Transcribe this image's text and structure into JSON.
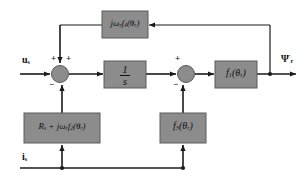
{
  "diagram": {
    "canvas": {
      "width": 307,
      "height": 182
    },
    "colors": {
      "block_fill": "#8c8c8c",
      "block_stroke": "#5a5a5a",
      "wire": "#1a1a1a",
      "background": "#ffffff",
      "text": "#111111"
    },
    "inputs": [
      {
        "id": "u_s",
        "label_html": "u<sub>s</sub>",
        "label_text": "us",
        "x": 22,
        "y": 57
      },
      {
        "id": "i_s",
        "label_html": "i<sub>s</sub>",
        "label_text": "is",
        "x": 22,
        "y": 156
      }
    ],
    "outputs": [
      {
        "id": "psi_r",
        "label_html": "Ψ<sup>′</sup><sub>r</sub>",
        "label_text": "Psi'r",
        "x": 283,
        "y": 58
      }
    ],
    "blocks": [
      {
        "id": "f4",
        "label_html": "jω<sub>r</sub>f<sub>4</sub>(θ<sub>r</sub>)",
        "label_text": "jωr f4(θr)",
        "x": 102,
        "y": 11,
        "w": 46,
        "h": 27,
        "font_size": 9
      },
      {
        "id": "integrator",
        "label_html": "",
        "label_text": "1/s",
        "numerator": "1",
        "denominator": "s",
        "x": 104,
        "y": 61,
        "w": 42,
        "h": 27,
        "font_size": 11
      },
      {
        "id": "f1",
        "label_html": "f<sub>1</sub>(θ<sub>r</sub>)",
        "label_text": "f1(θr)",
        "x": 215,
        "y": 61,
        "w": 42,
        "h": 27,
        "font_size": 10
      },
      {
        "id": "rs_jw_f2",
        "label_html": "R<sub>s</sub> + jω<sub>r</sub>f<sub>2</sub>(θ<sub>r</sub>)",
        "label_text": "Rs + jωr f2(θr)",
        "x": 24,
        "y": 113,
        "w": 76,
        "h": 30,
        "font_size": 9
      },
      {
        "id": "f3",
        "label_html": "f<sub>3</sub>(θ<sub>r</sub>)",
        "label_text": "f3(θr)",
        "x": 160,
        "y": 113,
        "w": 46,
        "h": 30,
        "font_size": 10
      }
    ],
    "summing_junctions": [
      {
        "id": "sum1",
        "cx": 60,
        "cy": 74,
        "r": 8.5,
        "signs": [
          {
            "symbol": "+",
            "x": 51,
            "y": 57
          },
          {
            "symbol": "+",
            "x": 66,
            "y": 57
          },
          {
            "symbol": "−",
            "x": 50,
            "y": 84
          }
        ]
      },
      {
        "id": "sum2",
        "cx": 186,
        "cy": 74,
        "r": 8.5,
        "signs": [
          {
            "symbol": "+",
            "x": 175,
            "y": 57
          },
          {
            "symbol": "−",
            "x": 174,
            "y": 84
          }
        ]
      }
    ],
    "junction_dots": [
      {
        "id": "output-tap",
        "cx": 270,
        "cy": 74
      },
      {
        "id": "is-bus-tap-left",
        "cx": 62,
        "cy": 168
      },
      {
        "id": "is-bus-tap-right",
        "cx": 183,
        "cy": 168
      }
    ]
  }
}
